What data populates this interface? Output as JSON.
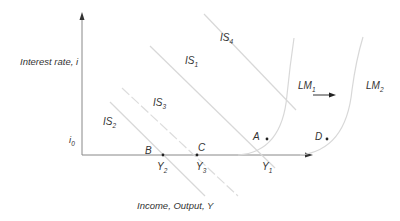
{
  "diagram": {
    "type": "IS-LM diagram",
    "axes": {
      "y_label": "Interest rate, i",
      "x_label": "Income, Output, Y",
      "i0_label": "i",
      "i0_sub": "0"
    },
    "curves": {
      "is1": {
        "base": "IS",
        "sub": "1"
      },
      "is2": {
        "base": "IS",
        "sub": "2"
      },
      "is3": {
        "base": "IS",
        "sub": "3"
      },
      "is4": {
        "base": "IS",
        "sub": "4"
      },
      "lm1": {
        "base": "LM",
        "sub": "1"
      },
      "lm2": {
        "base": "LM",
        "sub": "2"
      }
    },
    "points": {
      "a": "A",
      "b": "B",
      "c": "C",
      "d": "D"
    },
    "output_levels": {
      "y1": {
        "base": "Y",
        "sub": "1"
      },
      "y2": {
        "base": "Y",
        "sub": "2"
      },
      "y3": {
        "base": "Y",
        "sub": "3"
      }
    },
    "colors": {
      "axis": "#888888",
      "curve": "#d8d8d8",
      "text": "#333333",
      "arrow": "#222222"
    }
  }
}
